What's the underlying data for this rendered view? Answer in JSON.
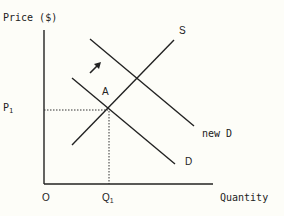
{
  "diagram": {
    "y_axis_label": "Price ($)",
    "x_axis_label": "Quantity",
    "origin_label": "O",
    "price_tick": {
      "base": "P",
      "sub": "1"
    },
    "quantity_tick": {
      "base": "Q",
      "sub": "1"
    },
    "point_label": "A",
    "curves": {
      "supply": "S",
      "demand": "D",
      "new_demand": "new D"
    },
    "arrow": "shift-right-arrow",
    "colors": {
      "line": "#222222",
      "background": "#fdfdf8"
    }
  }
}
